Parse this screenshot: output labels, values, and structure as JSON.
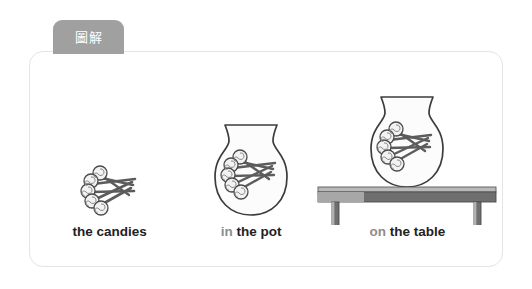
{
  "tab": {
    "label": "圖解",
    "background": "#a0a0a0",
    "text_color": "#ffffff"
  },
  "card": {
    "background": "#ffffff",
    "border_color": "#e4e4e4"
  },
  "panels": [
    {
      "id": "candies",
      "art": "lollipop-bunch",
      "label_prep": "",
      "label_main": "the candies"
    },
    {
      "id": "pot",
      "art": "pot-with-lollipops",
      "label_prep": "in",
      "label_main": "the pot"
    },
    {
      "id": "table",
      "art": "pot-on-table",
      "label_prep": "on",
      "label_main": "the table"
    }
  ],
  "colors": {
    "label_dark": "#222222",
    "label_prep": "#8d8d8d",
    "outline": "#3a3a3a",
    "candy_fill": "#f4f4f4",
    "stick_dark": "#555555",
    "table_top_light": "#b9b9b9",
    "table_top_dark": "#6d6d6d",
    "table_leg": "#6d6d6d",
    "pot_fill": "#fbfbfb"
  }
}
